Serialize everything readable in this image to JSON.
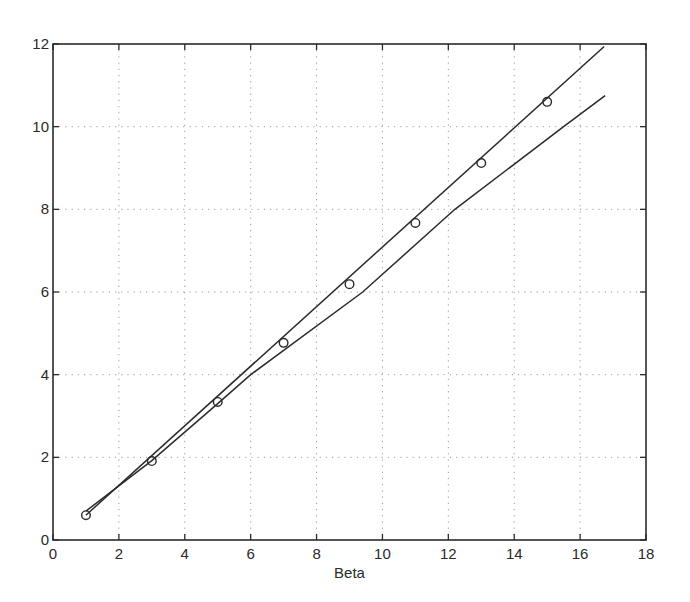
{
  "chart_data": {
    "type": "line",
    "title": "",
    "xlabel": "Beta",
    "ylabel": "",
    "xlim": [
      0,
      18
    ],
    "ylim": [
      0,
      12
    ],
    "grid": true,
    "grid_style": "dotted",
    "legend": null,
    "x_ticks": [
      0,
      2,
      4,
      6,
      8,
      10,
      12,
      14,
      16,
      18
    ],
    "y_ticks": [
      0,
      2,
      4,
      6,
      8,
      10,
      12
    ],
    "series": [
      {
        "name": "upper-line",
        "style": "solid",
        "x": [
          1,
          16.73
        ],
        "y": [
          0.6,
          11.94
        ]
      },
      {
        "name": "lower-line",
        "style": "solid",
        "x": [
          1,
          3,
          5,
          6,
          9.4,
          12.2,
          15.5,
          16.76
        ],
        "y": [
          0.7,
          1.92,
          3.3,
          4.0,
          6.0,
          8.0,
          10.0,
          10.75
        ]
      },
      {
        "name": "circle-markers",
        "style": "markers",
        "marker": "circle",
        "x": [
          1,
          3,
          5,
          7,
          9,
          11,
          13,
          15
        ],
        "y": [
          0.6,
          1.91,
          3.34,
          4.77,
          6.19,
          7.67,
          9.12,
          10.6
        ]
      }
    ]
  },
  "colors": {
    "line": "#2b2b2b",
    "grid": "#9a9a9a",
    "background": "#ffffff"
  }
}
